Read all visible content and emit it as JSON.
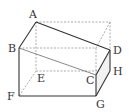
{
  "diagram": {
    "type": "cut-rectangular-prism",
    "labels": {
      "A": "A",
      "B": "B",
      "C": "C",
      "D": "D",
      "E": "E",
      "F": "F",
      "G": "G",
      "H": "H"
    },
    "vertices": {
      "A": [
        36,
        22
      ],
      "B": [
        19,
        48
      ],
      "C": [
        96,
        75
      ],
      "D": [
        110,
        50
      ],
      "E": [
        36,
        71
      ],
      "F": [
        19,
        96
      ],
      "G": [
        96,
        96
      ],
      "H": [
        110,
        71
      ],
      "P_top_back_right": [
        110,
        22
      ],
      "Q_top_front_right": [
        96,
        48
      ]
    },
    "solid_edges": [
      [
        "A",
        "B"
      ],
      [
        "A",
        "D"
      ],
      [
        "B",
        "F"
      ],
      [
        "F",
        "G"
      ],
      [
        "G",
        "C"
      ],
      [
        "C",
        "D"
      ],
      [
        "D",
        "H"
      ],
      [
        "H",
        "G"
      ],
      [
        "B",
        "C"
      ]
    ],
    "dashed_edges": [
      [
        "A",
        "P_top_back_right"
      ],
      [
        "P_top_back_right",
        "D"
      ],
      [
        "B",
        "Q_top_front_right"
      ],
      [
        "Q_top_front_right",
        "C"
      ],
      [
        "P_top_back_right",
        "Q_top_front_right"
      ],
      [
        "A",
        "E"
      ],
      [
        "E",
        "F"
      ],
      [
        "E",
        "H"
      ]
    ]
  }
}
